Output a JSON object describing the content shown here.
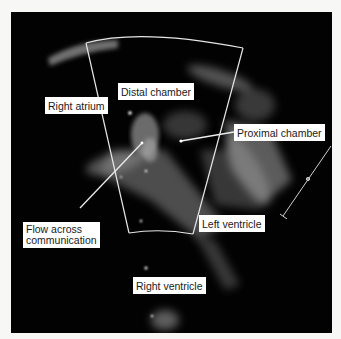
{
  "figure": {
    "labels": {
      "distal_chamber": "Distal chamber",
      "right_atrium": "Right atrium",
      "proximal_chamber": "Proximal chamber",
      "flow_line1": "Flow across",
      "flow_line2": "communication",
      "left_ventricle": "Left ventricle",
      "right_ventricle": "Right ventricle"
    },
    "colors": {
      "background": "#f7f7f5",
      "image_background": "#020202",
      "label_background": "#ffffff",
      "annotation_line": "#e8e8e8"
    }
  }
}
